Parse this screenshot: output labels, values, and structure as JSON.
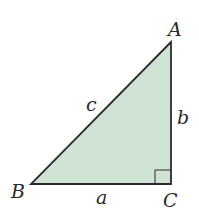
{
  "diagram": {
    "type": "right-triangle",
    "fill_color": "#cfe3d4",
    "stroke_color": "#2b2b2b",
    "vertices": {
      "A": {
        "label": "A",
        "x": 171,
        "y": 42
      },
      "B": {
        "label": "B",
        "x": 31,
        "y": 184
      },
      "C": {
        "label": "C",
        "x": 171,
        "y": 184
      }
    },
    "sides": {
      "a": {
        "label": "a",
        "between": "B-C"
      },
      "b": {
        "label": "b",
        "between": "A-C"
      },
      "c": {
        "label": "c",
        "between": "A-B"
      }
    },
    "right_angle_at": "C"
  }
}
